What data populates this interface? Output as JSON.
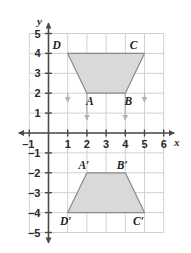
{
  "figure": {
    "axis_labels": {
      "x": "x",
      "y": "y"
    },
    "colors": {
      "grid": "#d0d0d0",
      "axis": "#4a4a4a",
      "shape_fill": "#d9d9d9",
      "shape_stroke": "#8a8a8a",
      "arrow": "#b4b4b4",
      "text": "#1e1e1e",
      "background": "#ffffff"
    },
    "x_axis": {
      "min": -1,
      "max": 6,
      "ticks": [
        -1,
        1,
        2,
        3,
        4,
        5,
        6
      ],
      "tick_labels": [
        "-1",
        "1",
        "2",
        "3",
        "4",
        "5",
        "6"
      ]
    },
    "y_axis": {
      "min": -5,
      "max": 5,
      "ticks": [
        5,
        4,
        3,
        2,
        1,
        -1,
        -2,
        -3,
        -4,
        -5
      ],
      "tick_labels": [
        "5",
        "4",
        "3",
        "2",
        "1",
        "-1",
        "-2",
        "-3",
        "-4",
        "-5"
      ]
    },
    "shapes": [
      {
        "name": "preimage-trapezoid",
        "vertices": [
          {
            "label": "D",
            "x": 1,
            "y": 4
          },
          {
            "label": "C",
            "x": 5,
            "y": 4
          },
          {
            "label": "B",
            "x": 4,
            "y": 2
          },
          {
            "label": "A",
            "x": 2,
            "y": 2
          }
        ]
      },
      {
        "name": "image-trapezoid",
        "vertices": [
          {
            "label": "A'",
            "x": 2,
            "y": -2
          },
          {
            "label": "B'",
            "x": 4,
            "y": -2
          },
          {
            "label": "C'",
            "x": 5,
            "y": -4
          },
          {
            "label": "D'",
            "x": 1,
            "y": -4
          }
        ]
      }
    ],
    "vertex_labels": [
      {
        "text": "D",
        "x": 1,
        "y": 4,
        "dx": -11,
        "dy": -4
      },
      {
        "text": "C",
        "x": 5,
        "y": 4,
        "dx": -11,
        "dy": -4
      },
      {
        "text": "A",
        "x": 2,
        "y": 2,
        "dx": 3,
        "dy": 12
      },
      {
        "text": "B",
        "x": 4,
        "y": 2,
        "dx": 3,
        "dy": 12
      },
      {
        "text": "A'",
        "x": 2,
        "y": -2,
        "dx": -3,
        "dy": -4
      },
      {
        "text": "B'",
        "x": 4,
        "y": -2,
        "dx": -3,
        "dy": -4
      },
      {
        "text": "D'",
        "x": 1,
        "y": -4,
        "dx": -2,
        "dy": 12
      },
      {
        "text": "C'",
        "x": 5,
        "y": -4,
        "dx": -6,
        "dy": 12
      }
    ],
    "translation_arrows": [
      {
        "x": 1,
        "y_start": 2.0,
        "y_end": 1.55
      },
      {
        "x": 2,
        "y_start": 2.0,
        "y_end": 0.65
      },
      {
        "x": 4,
        "y_start": 2.0,
        "y_end": 0.65
      },
      {
        "x": 5,
        "y_start": 2.0,
        "y_end": 1.55
      }
    ]
  }
}
